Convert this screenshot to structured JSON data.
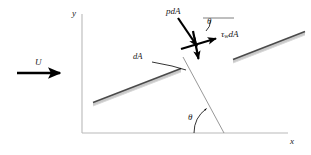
{
  "figure": {
    "background_color": "#ffffff",
    "width": 311,
    "height": 155
  },
  "axes": {
    "x_label": "x",
    "y_label": "y",
    "axis_color": "#b9b9b9",
    "origin": {
      "x": 82,
      "y": 133
    },
    "x_end": {
      "x": 288,
      "y": 133
    },
    "y_end": {
      "x": 82,
      "y": 14
    }
  },
  "freestream": {
    "label": "U",
    "arrow_color": "#000000",
    "start": {
      "x": 17,
      "y": 73
    },
    "end": {
      "x": 63,
      "y": 73
    }
  },
  "plates": [
    {
      "name": "lower-left-plate-segment",
      "start": {
        "x": 93,
        "y": 106
      },
      "end": {
        "x": 181,
        "y": 72
      },
      "face_color": "#c9c9c9",
      "edge_color": "#4a4a4a"
    },
    {
      "name": "upper-right-plate-segment",
      "start": {
        "x": 233,
        "y": 63
      },
      "end": {
        "x": 305,
        "y": 35
      },
      "face_color": "#c9c9c9",
      "edge_color": "#4a4a4a"
    }
  ],
  "normal_line": {
    "name": "plate-normal-reference-line",
    "color": "#8c8c8c",
    "start": {
      "x": 183,
      "y": 57
    },
    "end": {
      "x": 224,
      "y": 133
    }
  },
  "vectors": {
    "origin": {
      "x": 196,
      "y": 44
    },
    "pressure": {
      "label": "pdA",
      "label_parts": {
        "p": "p",
        "dA": "dA"
      },
      "tail": {
        "x": 178,
        "y": 18
      },
      "head": {
        "x": 199,
        "y": 49
      },
      "color": "#000000"
    },
    "shear": {
      "label": "τwdA",
      "label_parts": {
        "tau": "τ",
        "sub": "w",
        "dA": "dA"
      },
      "tail": {
        "x": 182,
        "y": 49
      },
      "head": {
        "x": 219,
        "y": 38
      },
      "color": "#000000"
    },
    "down": {
      "name": "resultant-down-arrow",
      "tail": {
        "x": 193,
        "y": 31
      },
      "head": {
        "x": 199,
        "y": 62
      },
      "color": "#000000"
    }
  },
  "angles": {
    "upper": {
      "label": "θ",
      "vertex": {
        "x": 199,
        "y": 31
      },
      "reference_line_start": {
        "x": 202,
        "y": 18
      },
      "reference_line_end": {
        "x": 233,
        "y": 18
      }
    },
    "lower": {
      "label": "θ",
      "vertex": {
        "x": 224,
        "y": 133
      },
      "arc_radius": 30
    }
  },
  "area_element": {
    "label": "dA",
    "label_pos": {
      "x": 136,
      "y": 57
    },
    "leader_start": {
      "x": 154,
      "y": 62
    },
    "leader_end": {
      "x": 186,
      "y": 70
    },
    "color": "#000000"
  }
}
